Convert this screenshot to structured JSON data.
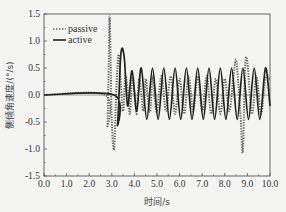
{
  "chart_data": {
    "type": "line",
    "title": "",
    "xlabel": "时间/s",
    "ylabel": "侧倾角速度/(°/s)",
    "xlim": [
      0,
      10
    ],
    "ylim": [
      -1.5,
      1.5
    ],
    "xticks": [
      "0.0",
      "1.0",
      "2.0",
      "3.0",
      "4.0",
      "5.0",
      "6.0",
      "7.0",
      "8.0",
      "9.0",
      "10.0"
    ],
    "yticks": [
      "1.5",
      "1.0",
      "0.5",
      "0.0",
      "-0.5",
      "-1.0",
      "-1.5"
    ],
    "grid": false,
    "legend_position": "upper left",
    "series": [
      {
        "name": "passive",
        "style": "dotted",
        "color": "#666666",
        "x": [
          0,
          2.7,
          2.8,
          2.85,
          2.9,
          2.95,
          3.0,
          3.1,
          3.2,
          3.3,
          3.4,
          3.5,
          3.6,
          3.7,
          3.8,
          3.9,
          4.0,
          4.1,
          4.2,
          4.3,
          4.4,
          4.5,
          4.6,
          4.7,
          4.8,
          4.9,
          5.0,
          5.2,
          5.4,
          5.6,
          5.8,
          6.0,
          6.2,
          6.4,
          6.6,
          6.8,
          7.0,
          7.2,
          7.4,
          7.6,
          7.8,
          8.0,
          8.2,
          8.4,
          8.5,
          8.6,
          8.7,
          8.8,
          8.9,
          9.0,
          9.2,
          9.4,
          9.6,
          9.8,
          10.0
        ],
        "y": [
          0,
          0,
          -0.6,
          0.2,
          1.45,
          0.6,
          -0.5,
          -1.0,
          0.1,
          0.75,
          0.2,
          -0.3,
          0.35,
          0.1,
          -0.35,
          0.3,
          0.05,
          -0.35,
          0.3,
          0.05,
          -0.3,
          0.3,
          -0.1,
          -0.3,
          0.35,
          -0.05,
          -0.3,
          0.35,
          -0.3,
          0.35,
          -0.35,
          0.3,
          -0.35,
          0.35,
          -0.3,
          0.35,
          -0.3,
          0.35,
          -0.35,
          0.3,
          -0.35,
          0.3,
          -0.3,
          0.4,
          0.65,
          0.2,
          -0.4,
          -1.05,
          0.5,
          0.6,
          -0.35,
          0.35,
          -0.35,
          0.3,
          0.3
        ]
      },
      {
        "name": "active",
        "style": "solid",
        "color": "#222222",
        "x": [
          0,
          3.1,
          3.25,
          3.4,
          3.55,
          3.7,
          3.9,
          4.1,
          4.3,
          4.55,
          4.8,
          5.05,
          5.3,
          5.55,
          5.8,
          6.05,
          6.3,
          6.55,
          6.8,
          7.05,
          7.3,
          7.55,
          7.8,
          8.05,
          8.3,
          8.55,
          8.8,
          9.05,
          9.3,
          9.55,
          9.8,
          10.0
        ],
        "y": [
          0,
          0,
          -0.55,
          0.75,
          0.7,
          -0.2,
          0.45,
          -0.3,
          0.5,
          -0.45,
          0.5,
          -0.45,
          0.5,
          -0.45,
          0.5,
          -0.45,
          0.5,
          -0.45,
          0.5,
          -0.45,
          0.5,
          -0.45,
          0.5,
          -0.45,
          0.5,
          -0.45,
          0.5,
          -0.45,
          0.5,
          -0.45,
          0.5,
          -0.2
        ]
      }
    ]
  },
  "legend": {
    "passive_label": "passive",
    "active_label": "active"
  },
  "axes": {
    "xlabel": "时间/s",
    "ylabel": "侧倾角速度/(°/s)"
  }
}
